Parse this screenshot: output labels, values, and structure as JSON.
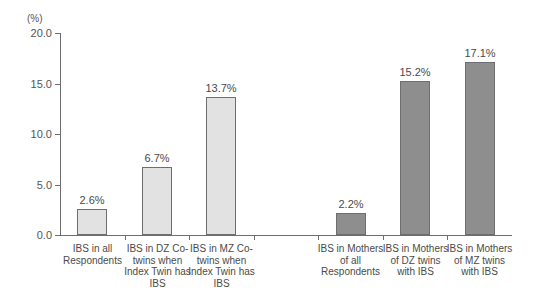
{
  "chart_data": {
    "type": "bar",
    "title": "",
    "xlabel": "",
    "ylabel": "",
    "unit_label": "(%)",
    "ylim": [
      0.0,
      20.0
    ],
    "yticks": [
      "0.0",
      "5.0",
      "10.0",
      "15.0",
      "20.0"
    ],
    "ytick_values": [
      0.0,
      5.0,
      10.0,
      15.0,
      20.0
    ],
    "grid": false,
    "legend": "none",
    "categories": [
      "IBS in all Respondents",
      "IBS in DZ Co-twins when Index Twin has IBS",
      "IBS in MZ Co-twins when Index Twin has IBS",
      "IBS in Mothers of all Respondents",
      "IBS in Mothers of DZ twins with IBS",
      "IBS in Mothers of MZ twins with IBS"
    ],
    "values": [
      2.6,
      6.7,
      13.7,
      2.2,
      15.2,
      17.1
    ],
    "value_labels": [
      "2.6%",
      "6.7%",
      "13.7%",
      "2.2%",
      "15.2%",
      "17.1%"
    ],
    "colors": [
      "#e2e2e2",
      "#e2e2e2",
      "#e2e2e2",
      "#8e8e8e",
      "#8e8e8e",
      "#8e8e8e"
    ],
    "bar_border_color": "#6e6e6e",
    "axis_color": "#6e6e6e",
    "text_color": "#4a4a4a",
    "label_lines": [
      [
        "IBS in all",
        "Respondents"
      ],
      [
        "IBS in DZ Co-",
        "twins when",
        "Index Twin has",
        "IBS"
      ],
      [
        "IBS in MZ Co-",
        "twins when",
        "Index Twin has",
        "IBS"
      ],
      [
        "IBS in Mothers",
        "of all",
        "Respondents"
      ],
      [
        "IBS in Mothers",
        "of DZ twins",
        "with IBS"
      ],
      [
        "IBS in Mothers",
        "of MZ twins",
        "with IBS"
      ]
    ]
  }
}
